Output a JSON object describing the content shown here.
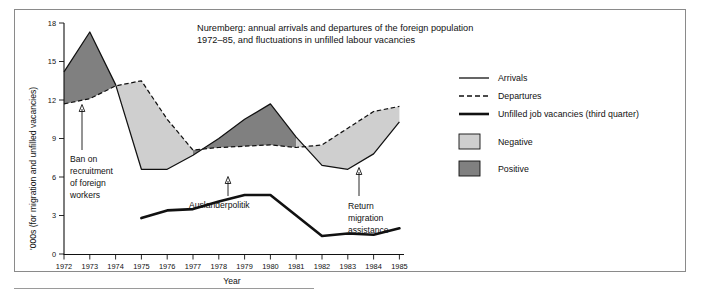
{
  "chart_data": {
    "type": "area",
    "title": "Nuremberg: annual arrivals and departures of the foreign population 1972–85, and fluctuations in unfilled labour vacancies",
    "title_line1": "Nuremberg: annual arrivals and departures of the foreign population",
    "title_line2": "1972–85, and fluctuations in unfilled labour vacancies",
    "xlabel": "Year",
    "ylabel": "'000s (for migration and unfilled vacancies)",
    "x": [
      1972,
      1973,
      1974,
      1975,
      1976,
      1977,
      1978,
      1979,
      1980,
      1981,
      1982,
      1983,
      1984,
      1985
    ],
    "categories": [
      "1972",
      "1973",
      "1974",
      "1975",
      "1976",
      "1977",
      "1978",
      "1979",
      "1980",
      "1981",
      "1982",
      "1983",
      "1984",
      "1985"
    ],
    "xlim": [
      1972,
      1985
    ],
    "ylim": [
      0,
      18
    ],
    "yticks": [
      0,
      3,
      6,
      9,
      12,
      15,
      18
    ],
    "ytick_labels": [
      "0",
      "3",
      "6",
      "9",
      "12",
      "15",
      "18"
    ],
    "grid": false,
    "legend_position": "right",
    "series": [
      {
        "name": "Arrivals",
        "style": "solid-thin",
        "values": [
          14.2,
          17.3,
          13.2,
          6.6,
          6.6,
          7.7,
          9.0,
          10.5,
          11.7,
          9.1,
          6.9,
          6.6,
          7.8,
          10.3
        ]
      },
      {
        "name": "Departures",
        "style": "dashed",
        "values": [
          11.7,
          12.1,
          13.1,
          13.5,
          10.5,
          8.1,
          8.3,
          8.4,
          8.5,
          8.3,
          8.5,
          9.8,
          11.1,
          11.5
        ]
      },
      {
        "name": "Unfilled job vacancies (third quarter)",
        "style": "solid-thick",
        "values": [
          null,
          null,
          null,
          2.8,
          3.4,
          3.5,
          4.1,
          4.6,
          4.6,
          3.0,
          1.4,
          1.6,
          1.5,
          2.0
        ]
      }
    ],
    "bands": [
      {
        "name": "Positive",
        "meaning": "arrivals above departures",
        "color": "#808080",
        "ranges": [
          [
            1972,
            1974
          ],
          [
            1977,
            1981
          ]
        ]
      },
      {
        "name": "Negative",
        "meaning": "departures above arrivals",
        "color": "#cfcfcf",
        "ranges": [
          [
            1974,
            1977
          ],
          [
            1981,
            1985
          ]
        ]
      }
    ],
    "annotations": [
      {
        "id": "ban-on-recruitment",
        "text": "Ban on recruitment of foreign workers",
        "lines": [
          "Ban on",
          "recruitment",
          "of foreign",
          "workers"
        ],
        "points_to_year": 1972.7,
        "points_to_value": 11.9
      },
      {
        "id": "auslanderpolitik",
        "text": "Auslanderpolitik",
        "lines": [
          "Auslanderpolitik"
        ],
        "points_to_year": 1978.0,
        "points_to_value": 8.3
      },
      {
        "id": "return-migration-assistance",
        "text": "Return migration assistance",
        "lines": [
          "Return",
          "migration",
          "assistance"
        ],
        "points_to_year": 1983.4,
        "points_to_value": 8.0
      }
    ]
  },
  "legend": {
    "items": [
      {
        "label": "Arrivals",
        "marker": "line-solid-thin"
      },
      {
        "label": "Departures",
        "marker": "line-dashed"
      },
      {
        "label": "Unfilled job vacancies (third quarter)",
        "marker": "line-solid-thick"
      },
      {
        "label": "Negative",
        "marker": "swatch-light"
      },
      {
        "label": "Positive",
        "marker": "swatch-dark"
      }
    ]
  },
  "colors": {
    "positive_band": "#808080",
    "negative_band": "#cfcfcf",
    "line": "#111111",
    "frame": "#8a8a8a",
    "background": "#ffffff"
  }
}
